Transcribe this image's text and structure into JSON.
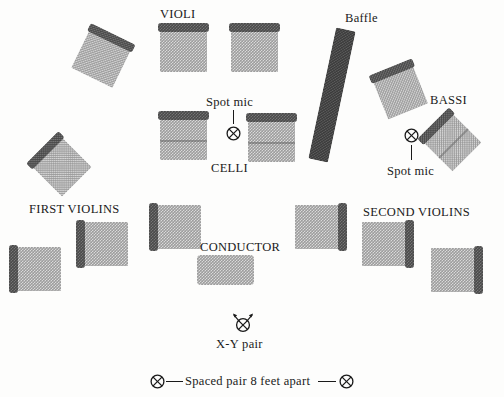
{
  "diagram": {
    "labels": {
      "violi": "VIOLI",
      "baffle": "Baffle",
      "bassi": "BASSI",
      "celli": "CELLI",
      "first_violins": "FIRST VIOLINS",
      "second_violins": "SECOND VIOLINS",
      "conductor": "CONDUCTOR",
      "spot_mic_left": "Spot mic",
      "spot_mic_right": "Spot mic",
      "xy_pair": "X-Y pair",
      "spaced_pair": "Spaced pair 8 feet apart"
    },
    "colors": {
      "deck_fill": "#9d9d9d",
      "deck_edge_bar": "#4a4a4a",
      "baffle_fill": "#3a3a3a",
      "ink": "#1a1a1a",
      "background": "#fdfdfc"
    },
    "sections": [
      {
        "name": "violi",
        "label": "VIOLI",
        "risers": [
          {
            "id": "violi-riser-left-outer",
            "x": 78,
            "y": 38,
            "w": 46,
            "h": 42,
            "rotation": 26,
            "bar": "top"
          },
          {
            "id": "violi-riser-center-left",
            "x": 160,
            "y": 30,
            "w": 47,
            "h": 42,
            "rotation": 0,
            "bar": "top"
          },
          {
            "id": "violi-riser-center-right",
            "x": 231,
            "y": 30,
            "w": 47,
            "h": 42,
            "rotation": 0,
            "bar": "top"
          }
        ]
      },
      {
        "name": "celli",
        "label": "CELLI",
        "risers": [
          {
            "id": "celli-riser-left",
            "x": 160,
            "y": 118,
            "w": 47,
            "h": 42,
            "rotation": 0,
            "bar": "top"
          },
          {
            "id": "celli-riser-right",
            "x": 248,
            "y": 120,
            "w": 47,
            "h": 42,
            "rotation": 0,
            "bar": "top"
          }
        ]
      },
      {
        "name": "bassi",
        "label": "BASSI",
        "risers": [
          {
            "id": "bassi-riser-upper",
            "x": 379,
            "y": 72,
            "w": 43,
            "h": 41,
            "rotation": -22,
            "bar": "top"
          },
          {
            "id": "bassi-riser-lower",
            "x": 432,
            "y": 122,
            "w": 41,
            "h": 41,
            "rotation": -45,
            "bar": "top"
          }
        ]
      },
      {
        "name": "first-violins",
        "label": "FIRST VIOLINS",
        "risers": [
          {
            "id": "first-violins-riser-outer",
            "x": 41,
            "y": 146,
            "w": 42,
            "h": 42,
            "rotation": 45,
            "bar": "left"
          },
          {
            "id": "first-violins-riser-far-left",
            "x": 16,
            "y": 247,
            "w": 45,
            "h": 44,
            "rotation": 0,
            "bar": "left"
          },
          {
            "id": "first-violins-riser-mid",
            "x": 83,
            "y": 222,
            "w": 45,
            "h": 44,
            "rotation": 0,
            "bar": "left"
          },
          {
            "id": "first-violins-riser-inner",
            "x": 156,
            "y": 205,
            "w": 45,
            "h": 44,
            "rotation": 0,
            "bar": "left"
          }
        ]
      },
      {
        "name": "second-violins",
        "label": "SECOND VIOLINS",
        "risers": [
          {
            "id": "second-violins-riser-inner",
            "x": 295,
            "y": 205,
            "w": 45,
            "h": 44,
            "rotation": 0,
            "bar": "right"
          },
          {
            "id": "second-violins-riser-mid",
            "x": 362,
            "y": 222,
            "w": 45,
            "h": 44,
            "rotation": 0,
            "bar": "right"
          },
          {
            "id": "second-violins-riser-far-right",
            "x": 431,
            "y": 248,
            "w": 45,
            "h": 44,
            "rotation": 0,
            "bar": "right"
          }
        ]
      },
      {
        "name": "conductor",
        "label": "CONDUCTOR",
        "risers": [
          {
            "id": "conductor-podium",
            "x": 197,
            "y": 255,
            "w": 57,
            "h": 30,
            "rotation": 0,
            "bar": "none"
          }
        ]
      }
    ],
    "baffle": {
      "x": 322,
      "y": 28,
      "w": 20,
      "h": 134,
      "rotation": 12
    },
    "microphones": [
      {
        "id": "spot-mic-celli",
        "label": "Spot mic",
        "symbol": "circled-x",
        "x": 226,
        "y": 126
      },
      {
        "id": "spot-mic-bassi",
        "label": "Spot mic",
        "symbol": "circled-x",
        "x": 404,
        "y": 128
      },
      {
        "id": "xy-pair-mic",
        "label": "X-Y pair",
        "symbol": "circled-x-with-arrows",
        "x": 230,
        "y": 314
      },
      {
        "id": "spaced-pair-mic-left",
        "label": "",
        "symbol": "circled-x",
        "x": 150,
        "y": 374
      },
      {
        "id": "spaced-pair-mic-right",
        "label": "",
        "symbol": "circled-x",
        "x": 339,
        "y": 374
      }
    ]
  }
}
